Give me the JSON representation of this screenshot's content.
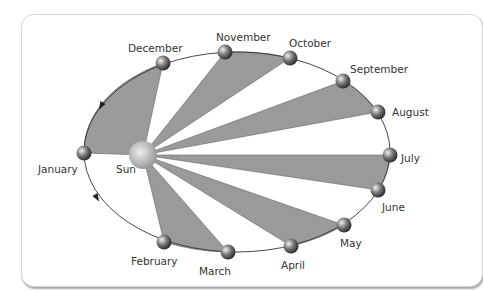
{
  "diagram": {
    "title": "",
    "center_body": {
      "label": "Sun",
      "x": 143,
      "y": 155,
      "r": 14
    },
    "orbit": {
      "cx": 237,
      "cy": 152,
      "rx": 153,
      "ry": 100
    },
    "colors": {
      "sector_fill": "#9a9a9a",
      "orbit_stroke": "#333333",
      "label": "#333333",
      "card_border": "#d6d6d6"
    },
    "months": [
      {
        "label": "January",
        "x": 84,
        "y": 153,
        "lx": 38,
        "ly": 173
      },
      {
        "label": "February",
        "x": 164,
        "y": 242,
        "lx": 131,
        "ly": 265
      },
      {
        "label": "March",
        "x": 228,
        "y": 252,
        "lx": 199,
        "ly": 275
      },
      {
        "label": "April",
        "x": 291,
        "y": 246,
        "lx": 281,
        "ly": 269
      },
      {
        "label": "May",
        "x": 344,
        "y": 225,
        "lx": 340,
        "ly": 247
      },
      {
        "label": "June",
        "x": 378,
        "y": 190,
        "lx": 382,
        "ly": 211
      },
      {
        "label": "July",
        "x": 390,
        "y": 155,
        "lx": 401,
        "ly": 162
      },
      {
        "label": "August",
        "x": 378,
        "y": 112,
        "lx": 392,
        "ly": 116
      },
      {
        "label": "September",
        "x": 343,
        "y": 81,
        "lx": 350,
        "ly": 73
      },
      {
        "label": "October",
        "x": 290,
        "y": 58,
        "lx": 289,
        "ly": 47
      },
      {
        "label": "November",
        "x": 225,
        "y": 52,
        "lx": 216,
        "ly": 41
      },
      {
        "label": "December",
        "x": 163,
        "y": 63,
        "lx": 128,
        "ly": 52
      }
    ],
    "sectors": [
      {
        "from": "January",
        "to": "December"
      },
      {
        "from": "November",
        "to": "October"
      },
      {
        "from": "September",
        "to": "August"
      },
      {
        "from": "July",
        "to": "June"
      },
      {
        "from": "May",
        "to": "April"
      },
      {
        "from": "March",
        "to": "February"
      }
    ],
    "arrows": [
      {
        "x": 101,
        "y": 106,
        "angle": 120
      },
      {
        "x": 97,
        "y": 198,
        "angle": 60
      }
    ]
  }
}
